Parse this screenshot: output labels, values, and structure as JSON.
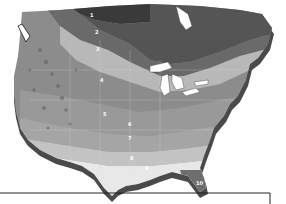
{
  "map": {
    "subject": "North America hardiness zones relief map",
    "style": "grayscale 3D extruded relief",
    "colors": {
      "background": "#ffffff",
      "zone1": "#3a3a3a",
      "zone2": "#555555",
      "zone3": "#6a6a6a",
      "zone4": "#b8b8b8",
      "zone5": "#8c8c8c",
      "zone6": "#999999",
      "zone7": "#a6a6a6",
      "zone8": "#c4c4c4",
      "zone9": "#e8e8e8",
      "zone10": "#6e6e6e",
      "extrusion": "#4a4a4a",
      "water": "#ffffff",
      "frame": "#222222"
    },
    "zone_labels": [
      {
        "text": "1",
        "x": 90,
        "y": 17
      },
      {
        "text": "2",
        "x": 95,
        "y": 34
      },
      {
        "text": "3",
        "x": 96,
        "y": 51
      },
      {
        "text": "4",
        "x": 100,
        "y": 82
      },
      {
        "text": "5",
        "x": 103,
        "y": 116
      },
      {
        "text": "6",
        "x": 128,
        "y": 126
      },
      {
        "text": "7",
        "x": 128,
        "y": 140
      },
      {
        "text": "8",
        "x": 130,
        "y": 160
      },
      {
        "text": "9",
        "x": 145,
        "y": 170
      },
      {
        "text": "10",
        "x": 198,
        "y": 185
      }
    ]
  }
}
